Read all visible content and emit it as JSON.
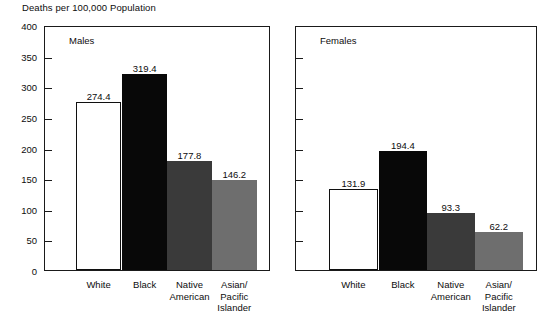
{
  "chart_data": {
    "type": "bar",
    "title": "Deaths per 100,000 Population",
    "xlabel": "",
    "ylabel": "",
    "ylim": [
      0,
      400
    ],
    "ytick_step": 50,
    "yticks": [
      400,
      350,
      300,
      250,
      200,
      150,
      100,
      50,
      0
    ],
    "grid": false,
    "legend": "none",
    "categories": [
      "White",
      "Black",
      "Native\nAmerican",
      "Asian/\nPacific\nIslander"
    ],
    "panels": [
      {
        "name": "Males",
        "values": [
          274.4,
          319.4,
          177.8,
          146.2
        ],
        "value_labels": [
          "274.4",
          "319.4",
          "177.8",
          "146.2"
        ]
      },
      {
        "name": "Females",
        "values": [
          131.9,
          194.4,
          93.3,
          62.2
        ],
        "value_labels": [
          "131.9",
          "194.4",
          "93.3",
          "62.2"
        ]
      }
    ],
    "series_colors": [
      "#ffffff",
      "#080808",
      "#3a3a3a",
      "#6e6e6e"
    ]
  },
  "axis": {
    "ytick_labels": [
      "400",
      "350",
      "300",
      "250",
      "200",
      "150",
      "100",
      "50",
      "0"
    ]
  }
}
